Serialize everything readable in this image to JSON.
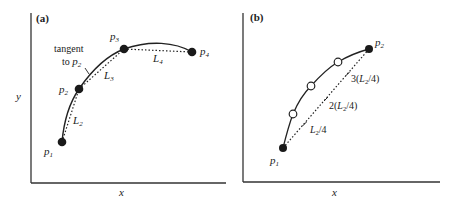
{
  "panel_a": {
    "label": "(a)",
    "x_axis_label": "x",
    "y_axis_label": "y",
    "annotation_line1": "tangent",
    "annotation_line2_prefix": "to ",
    "annotation_point": "p",
    "annotation_point_sub": "2",
    "points": [
      {
        "name": "p",
        "sub": "1"
      },
      {
        "name": "p",
        "sub": "2"
      },
      {
        "name": "p",
        "sub": "3"
      },
      {
        "name": "p",
        "sub": "4"
      }
    ],
    "segments": [
      {
        "name": "L",
        "sub": "2"
      },
      {
        "name": "L",
        "sub": "3"
      },
      {
        "name": "L",
        "sub": "4"
      }
    ]
  },
  "panel_b": {
    "label": "(b)",
    "x_axis_label": "x",
    "points": [
      {
        "name": "p",
        "sub": "1"
      },
      {
        "name": "p",
        "sub": "2"
      }
    ],
    "subdivisions": [
      {
        "pre": "",
        "L": "L",
        "sub": "2",
        "post": "/4"
      },
      {
        "pre": "2(",
        "L": "L",
        "sub": "2",
        "post": "/4)"
      },
      {
        "pre": "3(",
        "L": "L",
        "sub": "2",
        "post": "/4)"
      }
    ]
  },
  "colors": {
    "ink": "#222222",
    "background": "#ffffff"
  }
}
